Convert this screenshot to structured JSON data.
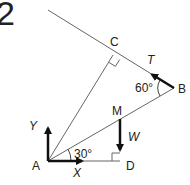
{
  "question_number": "2",
  "points": {
    "A": {
      "label": "A",
      "x": 48,
      "y": 161
    },
    "B": {
      "label": "B",
      "x": 174,
      "y": 88
    },
    "C": {
      "label": "C",
      "x": 113,
      "y": 55
    },
    "M": {
      "label": "M",
      "x": 120,
      "y": 119
    },
    "D": {
      "label": "D",
      "x": 120,
      "y": 161
    }
  },
  "forces": {
    "T": "T",
    "W": "W",
    "X": "X",
    "Y": "Y"
  },
  "angles": {
    "at_B": "60°",
    "at_A": "30°"
  },
  "colors": {
    "line": "#555555",
    "arrow": "#111111",
    "text": "#222222"
  }
}
